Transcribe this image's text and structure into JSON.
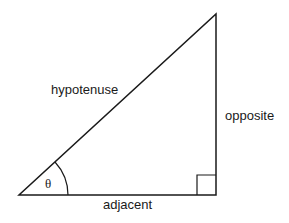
{
  "diagram": {
    "type": "right-triangle",
    "labels": {
      "hypotenuse": "hypotenuse",
      "opposite": "opposite",
      "adjacent": "adjacent",
      "angle": "θ"
    },
    "colors": {
      "stroke": "#1a1a1a",
      "background": "#ffffff"
    }
  }
}
